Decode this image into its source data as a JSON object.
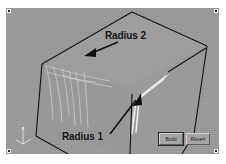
{
  "application": {
    "viewport_label": "3d-modeling-viewport",
    "background_color": "#9b9b9b",
    "figure_background": "#ffffff"
  },
  "annotations": [
    {
      "id": "radius-2",
      "label": "Radius 2",
      "arrow_from": [
        112,
        34
      ],
      "arrow_to": [
        82,
        46
      ],
      "color": "#121212"
    },
    {
      "id": "radius-1",
      "label": "Radius 1",
      "arrow_from": [
        104,
        126
      ],
      "arrow_to": [
        134,
        88
      ],
      "color": "#121212"
    }
  ],
  "callouts": {
    "radius_2": "Radius 2",
    "radius_1": "Radius 1"
  },
  "buttons": [
    {
      "id": "build",
      "label": "Build",
      "focused": true
    },
    {
      "id": "revert",
      "label": "Revert",
      "focused": false
    }
  ],
  "axis_triad": {
    "name": "coordinate-axis-triad",
    "axes": [
      "x",
      "y",
      "z"
    ],
    "color": "#e8e8e8"
  },
  "handles": {
    "count": 4,
    "positions": [
      "top-left",
      "top-right",
      "bottom-left",
      "bottom-right"
    ],
    "color": "#2b2b2b"
  },
  "geometry": {
    "description": "Shaded polygonal solid body with filleted edges shown in a CAD viewport",
    "edge_color": "#1a1a1a",
    "fillet_highlight_color": "#f0f0f0",
    "fillet_curve_color": "#cfcfcf",
    "body_outline": "126,4 201,38 188,126 120,146 36,146 17,56",
    "top_face": "126,4 201,38 122,78 36,56",
    "left_edge_path": "36,56 L 30,128 L 62,146",
    "right_edge_path": "201,38 L 188,126",
    "mid_vertical_path": "122,78 L 124,146"
  }
}
